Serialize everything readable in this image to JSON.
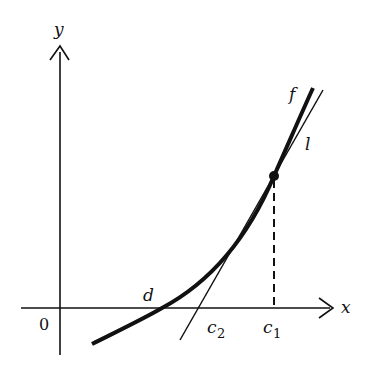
{
  "diagram": {
    "axes": {
      "x_label": "x",
      "y_label": "y",
      "origin_label": "0"
    },
    "curve": {
      "label": "f"
    },
    "tangent": {
      "label": "l"
    },
    "points": {
      "root_label": "d",
      "c1_label": "c",
      "c1_sub": "1",
      "c2_label": "c",
      "c2_sub": "2"
    },
    "colors": {
      "ink": "#111111",
      "background": "#ffffff"
    }
  }
}
